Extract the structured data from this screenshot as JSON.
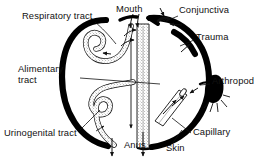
{
  "figure": {
    "type": "diagram",
    "background_color": "#ffffff",
    "ink_color": "#111111",
    "body_outline_color": "#000000"
  },
  "labels": [
    {
      "id": "respiratory-tract",
      "text": "Respiratory tract",
      "x": 22,
      "y": 16,
      "multiline": false
    },
    {
      "id": "mouth",
      "text": "Mouth",
      "x": 116,
      "y": 8,
      "multiline": false
    },
    {
      "id": "conjunctiva",
      "text": "Conjunctiva",
      "x": 179,
      "y": 9,
      "multiline": false
    },
    {
      "id": "trauma",
      "text": "Trauma",
      "x": 196,
      "y": 36,
      "multiline": false
    },
    {
      "id": "alimentary-tract",
      "text": "Alimentary tract",
      "x": 18,
      "y": 69,
      "multiline": true
    },
    {
      "id": "arthropod",
      "text": "Arthropod",
      "x": 212,
      "y": 81,
      "multiline": false
    },
    {
      "id": "urinogenital-tract",
      "text": "Urinogenital tract",
      "x": 6,
      "y": 133,
      "multiline": false
    },
    {
      "id": "anus",
      "text": "Anus",
      "x": 124,
      "y": 143,
      "multiline": false
    },
    {
      "id": "skin",
      "text": "Skin",
      "x": 166,
      "y": 146,
      "multiline": false
    },
    {
      "id": "capillary",
      "text": "Capillary",
      "x": 193,
      "y": 131,
      "multiline": false
    }
  ],
  "entry_routes": [
    "Respiratory tract",
    "Mouth",
    "Conjunctiva",
    "Trauma",
    "Alimentary tract",
    "Arthropod",
    "Urinogenital tract",
    "Anus",
    "Skin",
    "Capillary"
  ],
  "structures": [
    {
      "name": "body-outline",
      "description": "thick black bean / oval body wall"
    },
    {
      "name": "respiratory-tract-tube",
      "description": "stippled looped tube, upper left interior"
    },
    {
      "name": "alimentary-tract-tube",
      "description": "stippled long tube running from mouth to anus"
    },
    {
      "name": "urinogenital-tract-tube",
      "description": "stippled looped tube, lower left interior"
    },
    {
      "name": "capillary-tube",
      "description": "open-ended tube piercing the skin, lower right"
    },
    {
      "name": "arthropod-body",
      "description": "solid black insect silhouette outside the skin"
    }
  ]
}
